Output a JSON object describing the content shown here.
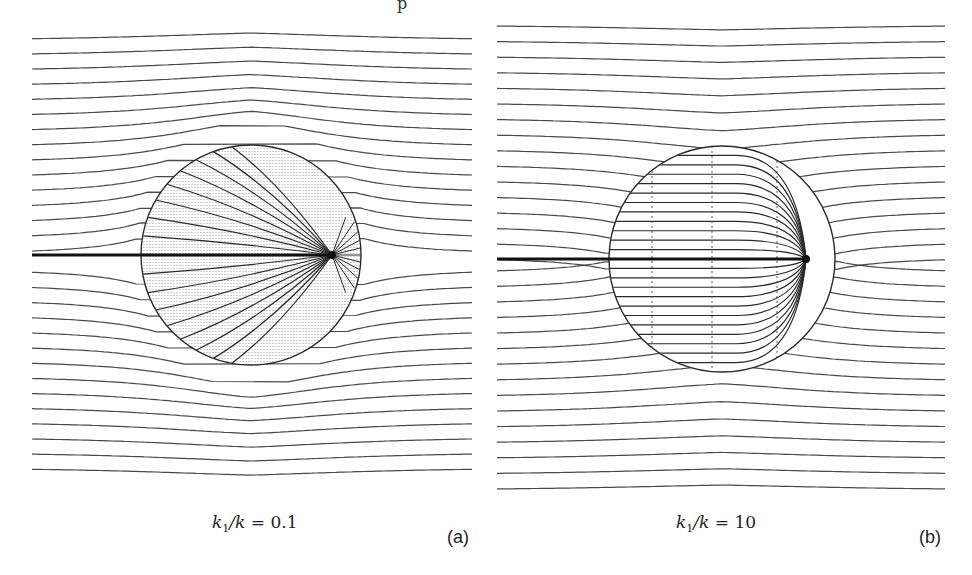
{
  "figure": {
    "header_fragment": "p",
    "panels": [
      {
        "id": "a",
        "tag": "(a)",
        "caption_lhs": "k",
        "caption_sub": "1",
        "caption_rest": "/k = ",
        "caption_value": "0.1",
        "ratio_k1_over_k": 0.1,
        "description": "Field lines and equipotentials around a sphere with a line source ending at a point near the right edge; low interior conductivity concentrates lines at the tip",
        "circle": {
          "cx": 251,
          "cy": 255,
          "r": 110
        },
        "source_tip": {
          "x": 332,
          "y": 255
        }
      },
      {
        "id": "b",
        "tag": "(b)",
        "caption_lhs": "k",
        "caption_sub": "1",
        "caption_rest": "/k = ",
        "caption_value": "10",
        "ratio_k1_over_k": 10,
        "description": "Field lines and equipotentials around a sphere with a line source; high interior conductivity makes the interior lines nearly parallel",
        "circle": {
          "cx": 236,
          "cy": 259,
          "r": 113
        },
        "source_tip": {
          "x": 320,
          "y": 259
        }
      }
    ],
    "colors": {
      "line": "#2a2a2a",
      "dotted": "#555555",
      "background": "#ffffff"
    }
  }
}
